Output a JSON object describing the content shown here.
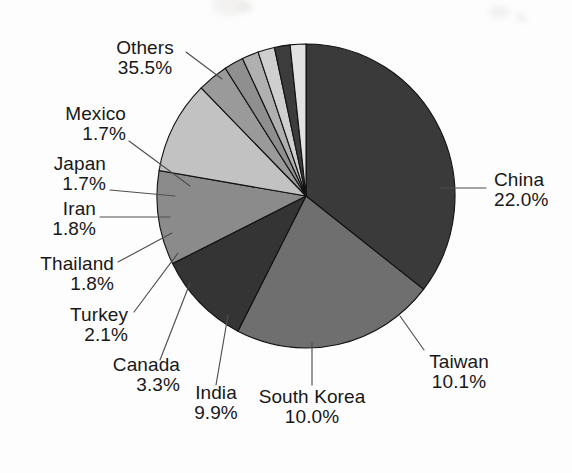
{
  "chart_data": {
    "type": "pie",
    "title": "",
    "subtitle": "",
    "xlabel": "",
    "ylabel": "",
    "units": "percent",
    "legend_position": "none",
    "labels_style": "outside-with-leader-lines",
    "start_angle_deg": 0,
    "direction": "clockwise",
    "grid": false,
    "categories": [
      "Others",
      "China",
      "Taiwan",
      "South Korea",
      "India",
      "Canada",
      "Turkey",
      "Thailand",
      "Iran",
      "Japan",
      "Mexico"
    ],
    "values": [
      35.5,
      22.0,
      10.1,
      10.0,
      9.9,
      3.3,
      2.1,
      1.8,
      1.8,
      1.7,
      1.7
    ],
    "value_labels": [
      "35.5%",
      "22.0%",
      "10.1%",
      "10.0%",
      "9.9%",
      "3.3%",
      "2.1%",
      "1.8%",
      "1.8%",
      "1.7%",
      "1.7%"
    ],
    "slice_colors": [
      "#3a3a3a",
      "#6f6f6f",
      "#343434",
      "#8b8b8b",
      "#c2c2c2",
      "#9a9a9a",
      "#8f8f8f",
      "#b0b0b0",
      "#cfcfcf",
      "#3c3c3c",
      "#e2e2e2"
    ],
    "total": 99.9
  },
  "slices": [
    {
      "name": "Others",
      "value": "35.5%",
      "color": "#3a3a3a"
    },
    {
      "name": "China",
      "value": "22.0%",
      "color": "#6f6f6f"
    },
    {
      "name": "Taiwan",
      "value": "10.1%",
      "color": "#343434"
    },
    {
      "name": "South Korea",
      "value": "10.0%",
      "color": "#8b8b8b"
    },
    {
      "name": "India",
      "value": "9.9%",
      "color": "#c2c2c2"
    },
    {
      "name": "Canada",
      "value": "3.3%",
      "color": "#9a9a9a"
    },
    {
      "name": "Turkey",
      "value": "2.1%",
      "color": "#8f8f8f"
    },
    {
      "name": "Thailand",
      "value": "1.8%",
      "color": "#b0b0b0"
    },
    {
      "name": "Iran",
      "value": "1.8%",
      "color": "#cfcfcf"
    },
    {
      "name": "Japan",
      "value": "1.7%",
      "color": "#3c3c3c"
    },
    {
      "name": "Mexico",
      "value": "1.7%",
      "color": "#e2e2e2"
    }
  ],
  "labels": {
    "others": {
      "name": "Others",
      "value": "35.5%"
    },
    "mexico": {
      "name": "Mexico",
      "value": "1.7%"
    },
    "japan": {
      "name": "Japan",
      "value": "1.7%"
    },
    "iran": {
      "name": "Iran",
      "value": "1.8%"
    },
    "thailand": {
      "name": "Thailand",
      "value": "1.8%"
    },
    "turkey": {
      "name": "Turkey",
      "value": "2.1%"
    },
    "canada": {
      "name": "Canada",
      "value": "3.3%"
    },
    "india": {
      "name": "India",
      "value": "9.9%"
    },
    "south_korea": {
      "name": "South Korea",
      "value": "10.0%"
    },
    "taiwan": {
      "name": "Taiwan",
      "value": "10.1%"
    },
    "china": {
      "name": "China",
      "value": "22.0%"
    }
  }
}
